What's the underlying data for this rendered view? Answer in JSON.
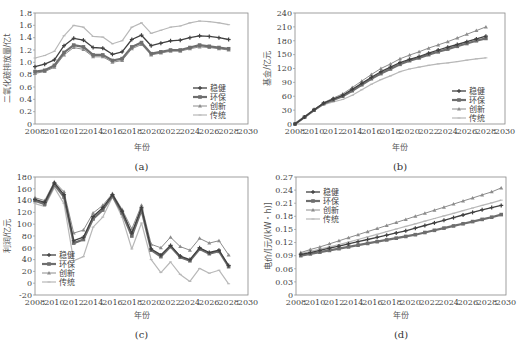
{
  "chart_data": [
    {
      "id": "a",
      "type": "line",
      "caption": "(a)",
      "xlabel": "年份",
      "ylabel": "二氧化碳排放量/亿t",
      "xlim": [
        2008,
        2030
      ],
      "ylim": [
        0,
        1.8
      ],
      "xticks": [
        2008,
        2010,
        2012,
        2014,
        2016,
        2018,
        2020,
        2022,
        2024,
        2026,
        2028,
        2030
      ],
      "yticks": [
        0,
        0.2,
        0.4,
        0.6,
        0.8,
        1.0,
        1.2,
        1.4,
        1.6,
        1.8
      ],
      "ytick_labels": [
        "0",
        "0.2",
        "0.4",
        "0.6",
        "0.8",
        "1.0",
        "1.2",
        "1.4",
        "1.6",
        "1.8"
      ],
      "legend_position": "lower-right",
      "x": [
        2008,
        2009,
        2010,
        2011,
        2012,
        2013,
        2014,
        2015,
        2016,
        2017,
        2018,
        2019,
        2020,
        2021,
        2022,
        2023,
        2024,
        2025,
        2026,
        2027,
        2028
      ],
      "series": [
        {
          "name": "稳健",
          "values": [
            0.93,
            0.97,
            1.04,
            1.27,
            1.39,
            1.36,
            1.24,
            1.23,
            1.13,
            1.17,
            1.37,
            1.44,
            1.27,
            1.31,
            1.35,
            1.36,
            1.4,
            1.43,
            1.42,
            1.4,
            1.37
          ]
        },
        {
          "name": "环保",
          "values": [
            0.85,
            0.87,
            0.95,
            1.16,
            1.28,
            1.25,
            1.12,
            1.12,
            1.03,
            1.06,
            1.25,
            1.32,
            1.14,
            1.17,
            1.2,
            1.2,
            1.24,
            1.28,
            1.26,
            1.24,
            1.22
          ]
        },
        {
          "name": "创新",
          "values": [
            0.82,
            0.85,
            0.92,
            1.12,
            1.24,
            1.21,
            1.09,
            1.09,
            1.0,
            1.03,
            1.22,
            1.29,
            1.12,
            1.15,
            1.18,
            1.18,
            1.22,
            1.25,
            1.24,
            1.22,
            1.2
          ]
        },
        {
          "name": "传统",
          "values": [
            1.07,
            1.11,
            1.18,
            1.43,
            1.6,
            1.57,
            1.42,
            1.41,
            1.3,
            1.35,
            1.57,
            1.64,
            1.47,
            1.52,
            1.57,
            1.59,
            1.64,
            1.67,
            1.66,
            1.64,
            1.61
          ]
        }
      ]
    },
    {
      "id": "b",
      "type": "line",
      "caption": "(b)",
      "xlabel": "年份",
      "ylabel": "基金/亿元",
      "xlim": [
        2008,
        2030
      ],
      "ylim": [
        0,
        240
      ],
      "xticks": [
        2008,
        2010,
        2012,
        2014,
        2016,
        2018,
        2020,
        2022,
        2024,
        2026,
        2028,
        2030
      ],
      "yticks": [
        0,
        30,
        60,
        90,
        120,
        150,
        180,
        210,
        240
      ],
      "ytick_labels": [
        "0",
        "30",
        "60",
        "90",
        "120",
        "150",
        "180",
        "210",
        "240"
      ],
      "legend_position": "lower-right",
      "x": [
        2008,
        2009,
        2010,
        2011,
        2012,
        2013,
        2014,
        2015,
        2016,
        2017,
        2018,
        2019,
        2020,
        2021,
        2022,
        2023,
        2024,
        2025,
        2026,
        2027,
        2028
      ],
      "series": [
        {
          "name": "稳健",
          "values": [
            0,
            15,
            31,
            45,
            54,
            62,
            75,
            88,
            101,
            113,
            123,
            133,
            140,
            146,
            153,
            160,
            166,
            172,
            178,
            184,
            190
          ]
        },
        {
          "name": "环保",
          "values": [
            0,
            15,
            30,
            44,
            52,
            60,
            72,
            85,
            98,
            109,
            119,
            129,
            137,
            143,
            150,
            156,
            162,
            168,
            174,
            180,
            185
          ]
        },
        {
          "name": "创新",
          "values": [
            0,
            15,
            31,
            46,
            56,
            65,
            79,
            93,
            107,
            120,
            130,
            141,
            149,
            156,
            164,
            171,
            178,
            186,
            194,
            202,
            210
          ]
        },
        {
          "name": "传统",
          "values": [
            0,
            14,
            29,
            42,
            48,
            53,
            62,
            74,
            86,
            96,
            104,
            113,
            119,
            123,
            127,
            130,
            132,
            135,
            138,
            141,
            143
          ]
        }
      ]
    },
    {
      "id": "c",
      "type": "line",
      "caption": "(c)",
      "xlabel": "年份",
      "ylabel": "利润/亿元",
      "xlim": [
        2008,
        2030
      ],
      "ylim": [
        -20,
        180
      ],
      "xticks": [
        2008,
        2010,
        2012,
        2014,
        2016,
        2018,
        2020,
        2022,
        2024,
        2026,
        2028,
        2030
      ],
      "yticks": [
        -20,
        0,
        20,
        40,
        60,
        80,
        100,
        120,
        140,
        160,
        180
      ],
      "ytick_labels": [
        "-20",
        "0",
        "20",
        "40",
        "60",
        "80",
        "100",
        "120",
        "140",
        "160",
        "180"
      ],
      "legend_position": "lower-left",
      "x": [
        2008,
        2009,
        2010,
        2011,
        2012,
        2013,
        2014,
        2015,
        2016,
        2017,
        2018,
        2019,
        2020,
        2021,
        2022,
        2023,
        2024,
        2025,
        2026,
        2027,
        2028
      ],
      "series": [
        {
          "name": "稳健",
          "values": [
            142,
            137,
            170,
            150,
            72,
            78,
            113,
            128,
            150,
            122,
            85,
            128,
            58,
            48,
            64,
            46,
            40,
            60,
            52,
            56,
            30
          ]
        },
        {
          "name": "环保",
          "values": [
            140,
            134,
            167,
            146,
            68,
            74,
            109,
            124,
            148,
            119,
            80,
            124,
            56,
            45,
            62,
            44,
            38,
            58,
            50,
            54,
            28
          ]
        },
        {
          "name": "创新",
          "values": [
            145,
            140,
            172,
            155,
            85,
            90,
            119,
            132,
            152,
            125,
            92,
            132,
            66,
            60,
            78,
            62,
            56,
            76,
            68,
            72,
            48
          ]
        },
        {
          "name": "传统",
          "values": [
            135,
            130,
            162,
            135,
            38,
            45,
            95,
            112,
            146,
            112,
            58,
            102,
            40,
            18,
            36,
            15,
            3,
            25,
            17,
            22,
            -1
          ]
        }
      ]
    },
    {
      "id": "d",
      "type": "line",
      "caption": "(d)",
      "xlabel": "年份",
      "ylabel": "电价/[元/(kW・h)]",
      "xlim": [
        2008,
        2030
      ],
      "ylim": [
        0,
        0.27
      ],
      "xticks": [
        2008,
        2010,
        2012,
        2014,
        2016,
        2018,
        2020,
        2022,
        2024,
        2026,
        2028,
        2030
      ],
      "yticks": [
        0,
        0.03,
        0.06,
        0.09,
        0.12,
        0.15,
        0.18,
        0.21,
        0.24,
        0.27
      ],
      "ytick_labels": [
        "0",
        "0.03",
        "0.06",
        "0.09",
        "0.12",
        "0.15",
        "0.18",
        "0.21",
        "0.24",
        "0.27"
      ],
      "legend_position": "upper-left",
      "x": [
        2008.5,
        2009.5,
        2010.5,
        2011.5,
        2012.5,
        2013.5,
        2014.5,
        2015.5,
        2016.5,
        2017.5,
        2018.5,
        2019.5,
        2020.5,
        2021.5,
        2022.5,
        2023.5,
        2024.5,
        2025.5,
        2026.5,
        2027.5,
        2028.5,
        2029.5
      ],
      "series": [
        {
          "name": "稳健",
          "values": [
            0.093,
            0.097,
            0.102,
            0.107,
            0.112,
            0.117,
            0.122,
            0.127,
            0.132,
            0.137,
            0.142,
            0.147,
            0.153,
            0.159,
            0.165,
            0.171,
            0.177,
            0.183,
            0.189,
            0.195,
            0.2,
            0.205
          ]
        },
        {
          "name": "环保",
          "values": [
            0.09,
            0.094,
            0.098,
            0.102,
            0.106,
            0.11,
            0.114,
            0.118,
            0.122,
            0.126,
            0.13,
            0.134,
            0.138,
            0.143,
            0.148,
            0.153,
            0.158,
            0.163,
            0.168,
            0.173,
            0.178,
            0.184
          ]
        },
        {
          "name": "创新",
          "values": [
            0.097,
            0.104,
            0.11,
            0.117,
            0.124,
            0.131,
            0.138,
            0.145,
            0.152,
            0.159,
            0.166,
            0.173,
            0.18,
            0.187,
            0.194,
            0.201,
            0.208,
            0.215,
            0.222,
            0.229,
            0.236,
            0.245
          ]
        },
        {
          "name": "传统",
          "values": [
            0.095,
            0.1,
            0.105,
            0.11,
            0.115,
            0.121,
            0.127,
            0.133,
            0.139,
            0.145,
            0.151,
            0.157,
            0.163,
            0.169,
            0.175,
            0.181,
            0.187,
            0.193,
            0.199,
            0.205,
            0.211,
            0.217
          ]
        }
      ]
    }
  ],
  "styles": {
    "稳健": {
      "color": "#404040",
      "marker": "plus",
      "width": 1.3
    },
    "环保": {
      "color": "#6e6e6e",
      "marker": "square",
      "width": 2.2
    },
    "创新": {
      "color": "#8c8c8c",
      "marker": "triangle",
      "width": 1.0
    },
    "传统": {
      "color": "#b8b8b8",
      "marker": "dash",
      "width": 1.2
    }
  }
}
